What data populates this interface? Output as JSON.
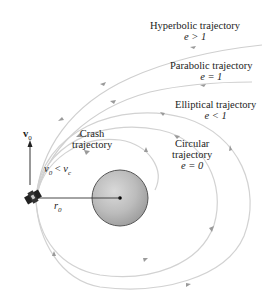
{
  "diagram": {
    "type": "orbital-trajectories",
    "trajectories": [
      {
        "name": "Hyperbolic trajectory",
        "condition": "e > 1"
      },
      {
        "name": "Parabolic trajectory",
        "condition": "e = 1"
      },
      {
        "name": "Elliptical trajectory",
        "condition": "e < 1"
      },
      {
        "name": "Circular trajectory",
        "name_line1": "Circular",
        "name_line2": "trajectory",
        "condition": "e = 0"
      },
      {
        "name": "Crash trajectory",
        "name_line1": "Crash",
        "name_line2": "trajectory",
        "condition": "v0 < vc"
      }
    ],
    "labels": {
      "velocity_vector": "v",
      "velocity_sub": "0",
      "radius": "r",
      "radius_sub": "0",
      "crash_cond_v": "v",
      "crash_cond_sub0": "0",
      "crash_cond_lt": " < ",
      "crash_cond_vc": "v",
      "crash_cond_subc": "c"
    },
    "colors": {
      "path": "#c8c8c8",
      "arrow": "#9a9a9a",
      "planet_fill": "#bdbdbd",
      "planet_stroke": "#555555",
      "text": "#222222"
    }
  }
}
